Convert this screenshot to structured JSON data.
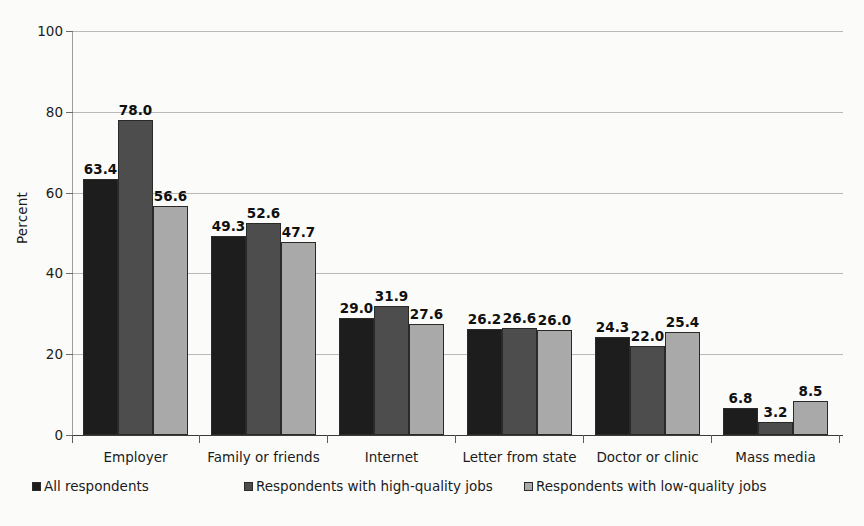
{
  "chart_data": {
    "type": "bar",
    "title": "",
    "xlabel": "",
    "ylabel": "Percent",
    "ylim": [
      0,
      100
    ],
    "yticks": [
      0,
      20,
      40,
      60,
      80,
      100
    ],
    "grid": true,
    "legend_position": "bottom",
    "value_label_format": "one-decimal",
    "categories": [
      "Employer",
      "Family or friends",
      "Internet",
      "Letter from state",
      "Doctor or clinic",
      "Mass media"
    ],
    "series": [
      {
        "name": "All respondents",
        "color": "#1d1d1d",
        "values": [
          63.4,
          49.3,
          29.0,
          26.2,
          24.3,
          6.8
        ],
        "labels": [
          "63.4",
          "49.3",
          "29.0",
          "26.2",
          "24.3",
          "6.8"
        ]
      },
      {
        "name": "Respondents with high-quality jobs",
        "color": "#4d4d4d",
        "values": [
          78.0,
          52.6,
          31.9,
          26.6,
          22.0,
          3.2
        ],
        "labels": [
          "78.0",
          "52.6",
          "31.9",
          "26.6",
          "22.0",
          "3.2"
        ]
      },
      {
        "name": "Respondents with low-quality jobs",
        "color": "#a9a9a9",
        "values": [
          56.6,
          47.7,
          27.6,
          26.0,
          25.4,
          8.5
        ],
        "labels": [
          "56.6",
          "47.7",
          "27.6",
          "26.0",
          "25.4",
          "8.5"
        ]
      }
    ]
  },
  "axis": {
    "y_title": "Percent",
    "y_tick_labels": [
      "0",
      "20",
      "40",
      "60",
      "80",
      "100"
    ]
  },
  "legend": {
    "items": [
      {
        "label": "All respondents"
      },
      {
        "label": "Respondents with high-quality jobs"
      },
      {
        "label": "Respondents with low-quality jobs"
      }
    ]
  },
  "colors": {
    "series_1": "#1d1d1d",
    "series_2": "#4d4d4d",
    "series_3": "#a9a9a9",
    "background": "#fbfbf9",
    "gridline": "#b9b9b9",
    "axis": "#3b3b3b"
  }
}
